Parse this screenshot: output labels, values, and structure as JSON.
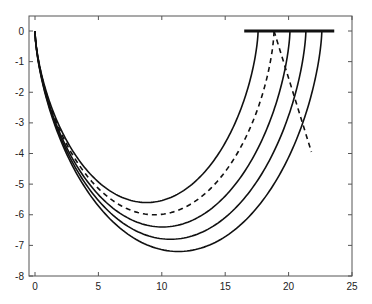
{
  "chart_data": {
    "type": "line",
    "title": "",
    "xlabel": "",
    "ylabel": "",
    "xlim": [
      0,
      25
    ],
    "ylim": [
      -8,
      0.5
    ],
    "grid": false,
    "legend": null,
    "x_ticks": [
      0,
      5,
      10,
      15,
      20,
      25
    ],
    "y_ticks": [
      0,
      -1,
      -2,
      -3,
      -4,
      -5,
      -6,
      -7,
      -8
    ],
    "x_tick_labels": [
      "0",
      "5",
      "10",
      "15",
      "20",
      "25"
    ],
    "y_tick_labels": [
      "0",
      "-1",
      "-2",
      "-3",
      "-4",
      "-5",
      "-6",
      "-7",
      "-8"
    ],
    "series": [
      {
        "name": "curve-1",
        "style": "solid",
        "shape": "cycloid",
        "radius": 2.8,
        "x_end": 17.6,
        "y_min": -5.6,
        "x_at_min": 8.8
      },
      {
        "name": "curve-dashed",
        "style": "dashed",
        "shape": "cycloid",
        "radius": 3.0,
        "x_end": 18.85,
        "y_min": -6.0,
        "x_at_min": 9.4
      },
      {
        "name": "curve-2",
        "style": "solid",
        "shape": "cycloid",
        "radius": 3.2,
        "x_end": 20.1,
        "y_min": -6.4,
        "x_at_min": 10.05
      },
      {
        "name": "curve-3",
        "style": "solid",
        "shape": "cycloid",
        "radius": 3.4,
        "x_end": 21.4,
        "y_min": -6.8,
        "x_at_min": 10.7
      },
      {
        "name": "curve-4",
        "style": "solid",
        "shape": "cycloid",
        "radius": 3.6,
        "x_end": 22.6,
        "y_min": -7.2,
        "x_at_min": 11.3
      }
    ],
    "annotations": [
      {
        "type": "horizontal-bar",
        "x": [
          16.5,
          23.6
        ],
        "y": 0,
        "style": "thick-solid"
      },
      {
        "type": "line",
        "style": "dashed",
        "x": [
          18.85,
          21.8
        ],
        "y": [
          0,
          -3.95
        ]
      }
    ]
  }
}
